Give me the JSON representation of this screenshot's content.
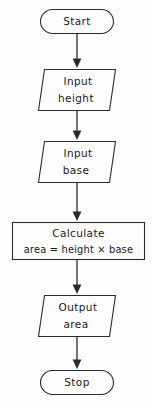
{
  "diagram": {
    "colors": {
      "background": "#fdfdfd",
      "stroke": "#2b2b2b",
      "text": "#1a1a1a",
      "fill": "#fdfdfd"
    },
    "nodes": [
      {
        "id": "start",
        "shape": "terminator",
        "lines": [
          "Start"
        ]
      },
      {
        "id": "input-height",
        "shape": "parallelogram",
        "lines": [
          "Input",
          "height"
        ]
      },
      {
        "id": "input-base",
        "shape": "parallelogram",
        "lines": [
          "Input",
          "base"
        ]
      },
      {
        "id": "calculate-area",
        "shape": "process",
        "lines": [
          "Calculate",
          "area = height × base"
        ]
      },
      {
        "id": "output-area",
        "shape": "parallelogram",
        "lines": [
          "Output",
          "area"
        ]
      },
      {
        "id": "stop",
        "shape": "terminator",
        "lines": [
          "Stop"
        ]
      }
    ],
    "connectors": [
      {
        "id": "start-to-input-height",
        "from": "start",
        "to": "input-height"
      },
      {
        "id": "input-height-to-input-base",
        "from": "input-height",
        "to": "input-base"
      },
      {
        "id": "input-base-to-calculate-area",
        "from": "input-base",
        "to": "calculate-area"
      },
      {
        "id": "calculate-area-to-output-area",
        "from": "calculate-area",
        "to": "output-area"
      },
      {
        "id": "output-area-to-stop",
        "from": "output-area",
        "to": "stop"
      }
    ]
  }
}
